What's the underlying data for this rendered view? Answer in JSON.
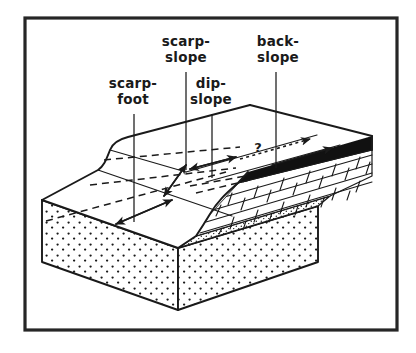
{
  "figure": {
    "frame": {
      "present": true,
      "color": "#262626",
      "x": 25,
      "y": 18,
      "width": 372,
      "height": 312
    },
    "background_color": "#ffffff",
    "ink_color": "#1a1a1a"
  },
  "labels": [
    {
      "id": "scarp-slope",
      "lines": [
        "scarp-",
        "slope"
      ],
      "line1": "scarp-",
      "line2": "slope",
      "x": 186,
      "y": 48,
      "leader_from_x": 186,
      "leader_from_y": 72,
      "leader_to_x": 186,
      "leader_to_y": 172
    },
    {
      "id": "back-slope",
      "lines": [
        "back-",
        "slope"
      ],
      "line1": "back-",
      "line2": "slope",
      "x": 278,
      "y": 48,
      "leader_from_x": 276,
      "leader_from_y": 72,
      "leader_to_x": 276,
      "leader_to_y": 172
    },
    {
      "id": "scarp-foot",
      "lines": [
        "scarp-",
        "foot"
      ],
      "line1": "scarp-",
      "line2": "foot",
      "x": 130,
      "y": 91,
      "leader_from_x": 134,
      "leader_from_y": 114,
      "leader_to_x": 134,
      "leader_to_y": 224
    },
    {
      "id": "dip-slope",
      "lines": [
        "dip-",
        "slope"
      ],
      "line1": "dip-",
      "line2": "slope",
      "x": 208,
      "y": 91,
      "leader_from_x": 212,
      "leader_from_y": 114,
      "leader_to_x": 212,
      "leader_to_y": 170
    }
  ],
  "annotations": {
    "question_mark": {
      "text": "?",
      "x": 258,
      "y": 152
    }
  },
  "strata": [
    {
      "id": "caprock-dark",
      "name": "dark caprock bed",
      "pattern": "solid-black",
      "color": "#111111"
    },
    {
      "id": "limestone",
      "name": "limestone",
      "pattern": "brick",
      "color": "#ffffff"
    },
    {
      "id": "fine-sand",
      "name": "fine sandy bed",
      "pattern": "fine-stipple",
      "color": "#ffffff"
    },
    {
      "id": "sandstone",
      "name": "sandstone",
      "pattern": "coarse-stipple",
      "color": "#ffffff"
    }
  ],
  "measurement_spans": [
    {
      "id": "scarp-foot-span",
      "style": "dashed",
      "arrowheads": "both"
    },
    {
      "id": "scarp-slope-span",
      "style": "dashed",
      "arrowheads": "both"
    },
    {
      "id": "dip-slope-span",
      "style": "dashed",
      "arrowheads": "both"
    },
    {
      "id": "back-slope-span",
      "style": "dotted",
      "arrowheads": "both"
    }
  ]
}
